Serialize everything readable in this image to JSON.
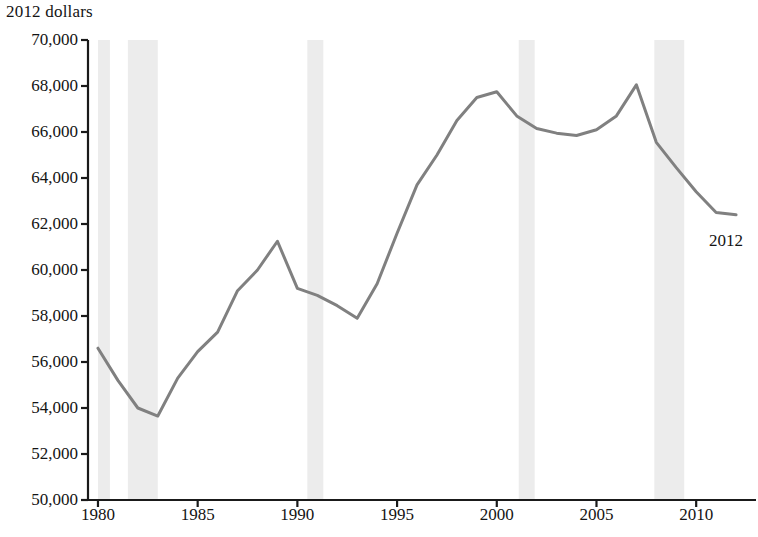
{
  "chart_data": {
    "type": "line",
    "title": "2012 dollars",
    "xlabel": "",
    "ylabel": "2012 dollars",
    "ylim": [
      50000,
      70000
    ],
    "xlim": [
      1979.5,
      2013.0
    ],
    "grid": false,
    "legend_position": "none",
    "y_ticks": [
      70000,
      68000,
      66000,
      64000,
      62000,
      60000,
      58000,
      56000,
      54000,
      52000,
      50000
    ],
    "y_tick_labels": [
      "70,000",
      "68,000",
      "66,000",
      "64,000",
      "62,000",
      "60,000",
      "58,000",
      "56,000",
      "54,000",
      "52,000",
      "50,000"
    ],
    "x_ticks": [
      1980,
      1985,
      1990,
      1995,
      2000,
      2005,
      2010
    ],
    "x_tick_labels": [
      "1980",
      "1985",
      "1990",
      "1995",
      "2000",
      "2005",
      "2010"
    ],
    "line_color": "#808080",
    "shading_color": "#ececec",
    "axis_color": "#1a1a1a",
    "series": [
      {
        "name": "2012 dollars",
        "x": [
          1980,
          1981,
          1982,
          1983,
          1984,
          1985,
          1986,
          1987,
          1988,
          1989,
          1990,
          1991,
          1992,
          1993,
          1994,
          1995,
          1996,
          1997,
          1998,
          1999,
          2000,
          2001,
          2002,
          2003,
          2004,
          2005,
          2006,
          2007,
          2008,
          2009,
          2010,
          2011,
          2012
        ],
        "values": [
          56600,
          55200,
          54000,
          53650,
          55300,
          56450,
          57300,
          59100,
          60000,
          61250,
          59200,
          58900,
          58450,
          57900,
          59400,
          61600,
          63700,
          65000,
          66500,
          67500,
          67750,
          66700,
          66150,
          65950,
          65850,
          66100,
          66700,
          68050,
          65550,
          64450,
          63400,
          62500,
          62400
        ]
      }
    ],
    "annotations": [
      {
        "text": "2012",
        "x": 2012,
        "y": 62400
      }
    ],
    "recession_bands": [
      {
        "start": 1980.0,
        "end": 1980.6
      },
      {
        "start": 1981.5,
        "end": 1983.0
      },
      {
        "start": 1990.5,
        "end": 1991.3
      },
      {
        "start": 2001.1,
        "end": 2001.9
      },
      {
        "start": 2007.9,
        "end": 2009.4
      }
    ]
  },
  "labels": {
    "axis_title": "2012 dollars",
    "annotation_2012": "2012"
  }
}
